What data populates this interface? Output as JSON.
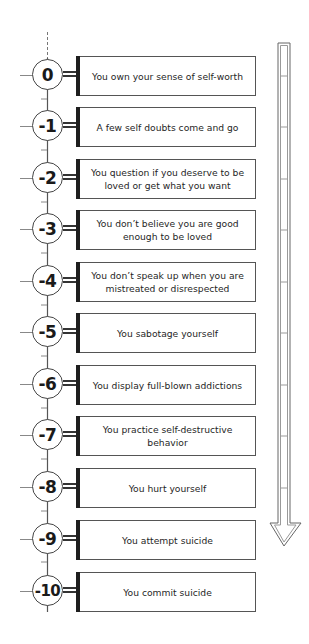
{
  "diagram": {
    "title": "",
    "type": "descending scale of self-worth",
    "direction_arrow": "down-arrow",
    "levels": [
      {
        "score": "0",
        "text": "You own your sense of self-worth"
      },
      {
        "score": "-1",
        "text": "A few self doubts come and go"
      },
      {
        "score": "-2",
        "text": "You question if you deserve to be loved or get what you want"
      },
      {
        "score": "-3",
        "text": "You don’t believe you are good enough to be loved"
      },
      {
        "score": "-4",
        "text": "You don’t speak up when you are mistreated or disrespected"
      },
      {
        "score": "-5",
        "text": "You sabotage yourself"
      },
      {
        "score": "-6",
        "text": "You display full-blown addictions"
      },
      {
        "score": "-7",
        "text": "You practice self-destructive behavior"
      },
      {
        "score": "-8",
        "text": "You hurt yourself"
      },
      {
        "score": "-9",
        "text": "You attempt suicide"
      },
      {
        "score": "-10",
        "text": "You commit suicide"
      }
    ]
  },
  "colors": {
    "line": "#444444",
    "bar": "#1e1e1e",
    "background": "#ffffff",
    "text": "#1f1f1f"
  }
}
